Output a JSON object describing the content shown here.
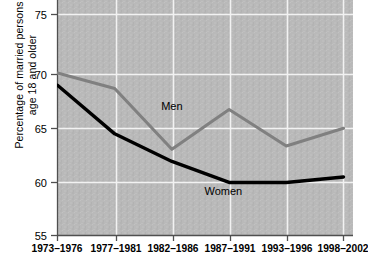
{
  "chart_data": {
    "type": "line",
    "title": "",
    "subtitle": "",
    "xlabel": "",
    "ylabel": "Percentage of married persons age 18 and older",
    "ylabel_line1": "Percentage of married persons",
    "ylabel_line2": "age 18 and older",
    "categories": [
      "1973–1976",
      "1977–1981",
      "1982–1986",
      "1987–1991",
      "1993–1996",
      "1998–2002"
    ],
    "ylim": [
      55,
      75
    ],
    "yticks": [
      55,
      60,
      65,
      70,
      75
    ],
    "ytick_labels": [
      "55",
      "60",
      "65",
      "70",
      "75"
    ],
    "grid": true,
    "legend_position": "inline-annotation",
    "series": [
      {
        "name": "Men",
        "color": "#808080",
        "values": [
          69.7,
          68.3,
          62.8,
          66.4,
          63.1,
          64.7
        ],
        "annotation": "Men"
      },
      {
        "name": "Women",
        "color": "#000000",
        "values": [
          68.6,
          64.2,
          61.7,
          59.8,
          59.8,
          60.3
        ],
        "annotation": "Women"
      }
    ],
    "annotations": [
      {
        "text": "Men",
        "x_index": 2.0,
        "y_value": 66.4
      },
      {
        "text": "Women",
        "x_index": 2.9,
        "y_value": 58.7
      }
    ],
    "colors": {
      "plot_background": "#b8b8b8",
      "gridline": "#f2f2f2",
      "axis": "#555555",
      "men_line": "#808080",
      "women_line": "#000000",
      "text": "#000000",
      "page_background": "#ffffff"
    }
  }
}
